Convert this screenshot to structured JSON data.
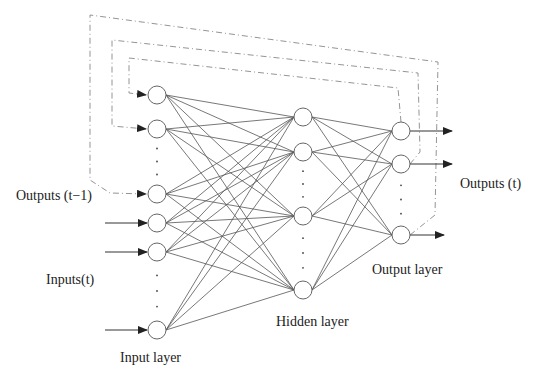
{
  "diagram": {
    "colors": {
      "line": "#555555",
      "node_stroke": "#666666",
      "dash": "#888888",
      "text": "#222222"
    },
    "labels": {
      "outputs_prev": "Outputs (t−1)",
      "inputs": "Inputs(t)",
      "outputs": "Outputs (t)",
      "input_layer": "Input layer",
      "hidden_layer": "Hidden layer",
      "output_layer": "Output layer"
    },
    "layers": {
      "input": {
        "x": 157,
        "nodes_y": [
          95,
          129,
          194,
          223,
          252,
          330
        ],
        "ellipsis_after_index": [
          1,
          4
        ]
      },
      "hidden": {
        "x": 303,
        "nodes_y": [
          117,
          152,
          216,
          290
        ],
        "ellipsis_after_index": [
          1,
          2
        ]
      },
      "output": {
        "x": 401,
        "nodes_y": [
          131,
          164,
          235
        ],
        "ellipsis_after_index": [
          1
        ]
      }
    },
    "node_radius": 9,
    "feedback_loops": [
      {
        "from_output": 2,
        "to_input": 2,
        "path": [
          [
            410,
            235
          ],
          [
            435,
            215
          ],
          [
            438,
            62
          ],
          [
            90,
            15
          ],
          [
            90,
            180
          ],
          [
            110,
            193
          ],
          [
            146,
            194
          ]
        ]
      },
      {
        "from_output": 1,
        "to_input": 1,
        "path": [
          [
            410,
            164
          ],
          [
            420,
            152
          ],
          [
            418,
            73
          ],
          [
            112,
            40
          ],
          [
            112,
            126
          ],
          [
            146,
            129
          ]
        ]
      },
      {
        "from_output": 0,
        "to_input": 0,
        "path": [
          [
            401,
            122
          ],
          [
            398,
            88
          ],
          [
            129,
            58
          ],
          [
            129,
            93
          ],
          [
            146,
            95
          ]
        ]
      }
    ],
    "external_inputs_to": [
      3,
      4,
      5
    ]
  }
}
